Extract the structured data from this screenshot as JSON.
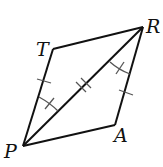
{
  "diagram": {
    "type": "geometry-quadrilateral",
    "vertices": [
      {
        "label": "P",
        "x": 23,
        "y": 146,
        "label_x": 4,
        "label_y": 158
      },
      {
        "label": "T",
        "x": 53,
        "y": 49,
        "label_x": 36,
        "label_y": 56
      },
      {
        "label": "R",
        "x": 143,
        "y": 27,
        "label_x": 146,
        "label_y": 33
      },
      {
        "label": "A",
        "x": 115,
        "y": 125,
        "label_x": 114,
        "label_y": 142
      }
    ],
    "segments": [
      {
        "from": "P",
        "to": "T",
        "ticks": 1
      },
      {
        "from": "T",
        "to": "R",
        "ticks": 0
      },
      {
        "from": "R",
        "to": "A",
        "ticks": 1
      },
      {
        "from": "A",
        "to": "P",
        "ticks": 0
      },
      {
        "from": "P",
        "to": "R",
        "ticks": 2,
        "note": "diagonal"
      }
    ],
    "angle_marks": [
      {
        "angle": "TPR",
        "arcs": 1,
        "ticks": 1
      },
      {
        "angle": "ARP",
        "arcs": 1,
        "ticks": 1
      }
    ],
    "stroke_color": "#111111"
  }
}
